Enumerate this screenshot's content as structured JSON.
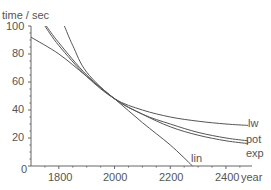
{
  "chart_data": {
    "type": "line",
    "title": "",
    "xlabel": "year",
    "ylabel": "time / sec",
    "xlim": [
      1700,
      2490
    ],
    "ylim": [
      0,
      100
    ],
    "xticks": [
      1800,
      2000,
      2200,
      2400
    ],
    "yticks": [
      0,
      20,
      40,
      60,
      80,
      100
    ],
    "grid": false,
    "legend": "inline labels at curve ends",
    "series": [
      {
        "name": "lin",
        "x": [
          1700,
          1800,
          1900,
          2000,
          2100,
          2200,
          2280
        ],
        "y": [
          92,
          80,
          64,
          48,
          31,
          15,
          0
        ]
      },
      {
        "name": "lw",
        "x": [
          1750,
          1800,
          1900,
          2000,
          2100,
          2200,
          2300,
          2400,
          2480
        ],
        "y": [
          100,
          86,
          64,
          48,
          40,
          35,
          32,
          30,
          29
        ]
      },
      {
        "name": "pot",
        "x": [
          1755,
          1800,
          1900,
          2000,
          2100,
          2200,
          2300,
          2400,
          2480
        ],
        "y": [
          100,
          88,
          65,
          48,
          37,
          30,
          24,
          20,
          18
        ]
      },
      {
        "name": "exp",
        "x": [
          1820,
          1850,
          1900,
          2000,
          2100,
          2200,
          2300,
          2400,
          2480
        ],
        "y": [
          100,
          86,
          67,
          48,
          37,
          28,
          22,
          18,
          16
        ]
      }
    ]
  },
  "labels": {
    "ylabel": "time / sec",
    "xlabel": "year",
    "y100": "100",
    "y80": "80",
    "y60": "60",
    "y40": "40",
    "y20": "20",
    "y0": "0",
    "x1800": "1800",
    "x2000": "2000",
    "x2200": "2200",
    "x2400": "2400",
    "lin": "lin",
    "lw": "lw",
    "pot": "pot",
    "exp": "exp"
  }
}
